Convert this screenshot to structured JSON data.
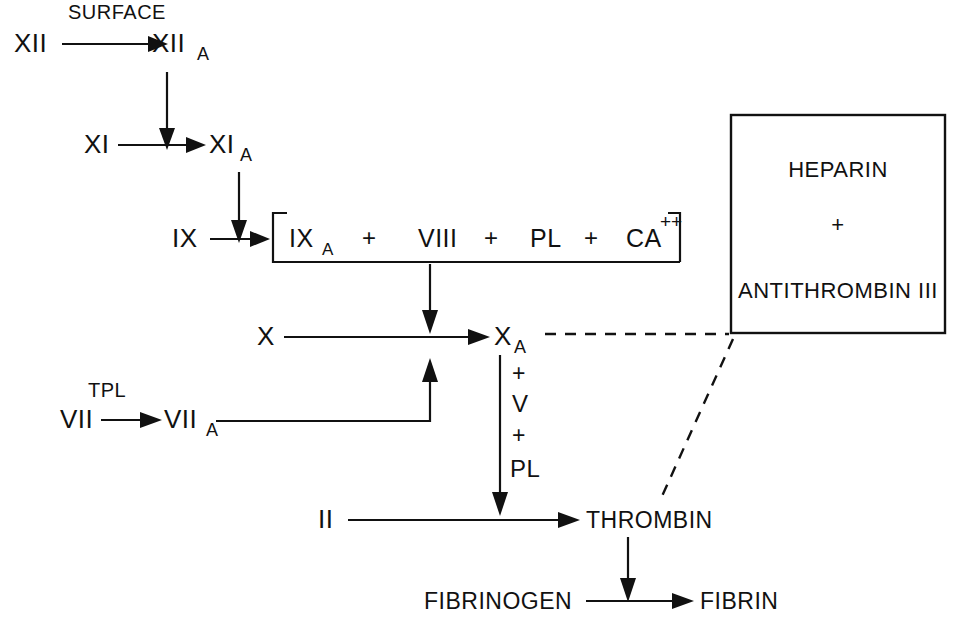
{
  "diagram": {
    "colors": {
      "ink": "#111111",
      "background": "#ffffff"
    },
    "labels": {
      "surface": "SURFACE",
      "tpl": "TPL",
      "factor_xii": "XII",
      "factor_xii_a": "XII",
      "factor_xii_a_sub": "A",
      "factor_xi": "XI",
      "factor_xi_a": "XI",
      "factor_xi_a_sub": "A",
      "factor_ix": "IX",
      "factor_ix_a": "IX",
      "factor_ix_a_sub": "A",
      "factor_viii": "VIII",
      "pl_complex": "PL",
      "calcium": "CA",
      "calcium_sup": "++",
      "plus_1": "+",
      "plus_2": "+",
      "plus_3": "+",
      "factor_x": "X",
      "factor_x_a": "X",
      "factor_x_a_sub": "A",
      "factor_vii": "VII",
      "factor_vii_a": "VII",
      "factor_vii_a_sub": "A",
      "cofactor_plus_top": "+",
      "cofactor_v": "V",
      "cofactor_plus_bottom": "+",
      "cofactor_pl": "PL",
      "factor_ii": "II",
      "thrombin": "THROMBIN",
      "fibrinogen": "FIBRINOGEN",
      "fibrin": "FIBRIN",
      "heparin": "HEPARIN",
      "heparin_plus": "+",
      "antithrombin": "ANTITHROMBIN III"
    },
    "inhibitor_box": {
      "lines": [
        "HEPARIN",
        "+",
        "ANTITHROMBIN III"
      ]
    },
    "reactions": [
      {
        "from": "XII",
        "to": "XIIA",
        "catalyst": "SURFACE"
      },
      {
        "from": "XI",
        "to": "XIA",
        "catalyst": "XIIA"
      },
      {
        "from": "IX",
        "to": "IXA",
        "catalyst": "XIA"
      },
      {
        "from": "X",
        "to": "XA",
        "catalyst": "IXA + VIII + PL + CA++"
      },
      {
        "from": "VII",
        "to": "VIIA",
        "catalyst": "TPL"
      },
      {
        "from": "VIIA",
        "to": "XA",
        "catalyst": ""
      },
      {
        "from": "II",
        "to": "THROMBIN",
        "catalyst": "XA + V + PL"
      },
      {
        "from": "FIBRINOGEN",
        "to": "FIBRIN",
        "catalyst": "THROMBIN"
      }
    ],
    "inhibition_targets": [
      "XA",
      "THROMBIN"
    ]
  }
}
